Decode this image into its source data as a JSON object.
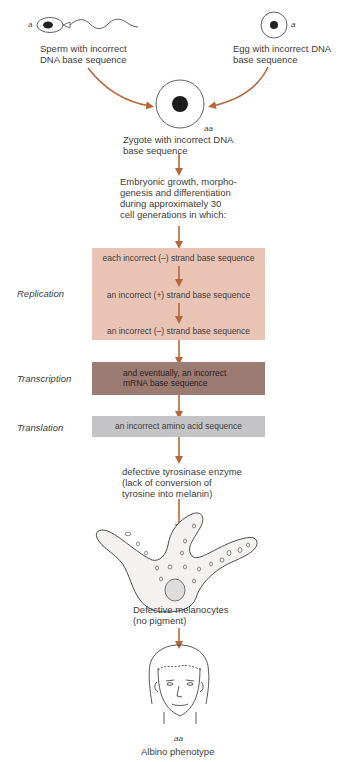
{
  "colors": {
    "arrow": "#b5663a",
    "replication_box": "#e9c4b4",
    "transcription_box": "#9c7b73",
    "translation_box": "#c4c4c6",
    "line": "#3a3a3a"
  },
  "top": {
    "sperm": {
      "allele": "a",
      "label_line1": "Sperm with incorrect",
      "label_line2": "DNA base sequence",
      "icon": "sperm-cell-icon"
    },
    "egg": {
      "allele": "a",
      "label_line1": "Egg with incorrect DNA",
      "label_line2": "base sequence",
      "icon": "egg-cell-icon"
    },
    "zygote": {
      "genotype": "aa",
      "label_line1": "Zygote with incorrect DNA",
      "label_line2": "base sequence",
      "icon": "zygote-cell-icon"
    }
  },
  "embryo": {
    "lines": [
      "Embryonic growth, morpho-",
      "genesis and differentiation",
      "during approximately 30",
      "cell generations in which:"
    ]
  },
  "stages": {
    "replication": {
      "label": "Replication",
      "steps": [
        "each incorrect (–) strand base sequence",
        "an incorrect (+) strand base sequence",
        "an incorrect (–) strand base sequence"
      ]
    },
    "transcription": {
      "label": "Transcription",
      "line1": "and eventually, an incorrect",
      "line2": "mRNA base sequence"
    },
    "translation": {
      "label": "Translation",
      "text": "an incorrect amino acid sequence"
    }
  },
  "enzyme": {
    "lines": [
      "defective tyrosinase enzyme",
      "(lack of conversion of",
      "tyrosine into melanin)"
    ]
  },
  "melanocyte": {
    "line1": "Defective melanocytes",
    "line2": "(no pigment)",
    "icon": "melanocyte-cell-icon"
  },
  "phenotype": {
    "genotype": "aa",
    "label": "Albino phenotype",
    "icon": "human-face-icon"
  }
}
